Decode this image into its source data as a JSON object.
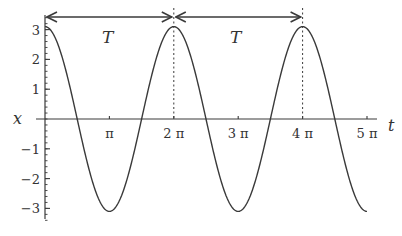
{
  "chart_data": {
    "type": "line",
    "title": "",
    "xlabel": "t",
    "ylabel": "x",
    "function": "x = 3.1 cos(t)",
    "amplitude": 3.1,
    "xlim": [
      0,
      5.0
    ],
    "xlim_units": "pi",
    "ylim": [
      -3.3,
      3.4
    ],
    "x_ticks": [
      {
        "value_pi": 1,
        "label": "π"
      },
      {
        "value_pi": 2,
        "label": "2 π"
      },
      {
        "value_pi": 3,
        "label": "3 π"
      },
      {
        "value_pi": 4,
        "label": "4 π"
      },
      {
        "value_pi": 5,
        "label": "5 π"
      }
    ],
    "y_ticks": [
      {
        "value": 3,
        "label": "3"
      },
      {
        "value": 2,
        "label": "2"
      },
      {
        "value": 1,
        "label": "1"
      },
      {
        "value": -1,
        "label": "-1"
      },
      {
        "value": -2,
        "label": "-2"
      },
      {
        "value": -3,
        "label": "-3"
      }
    ],
    "series": [
      {
        "name": "x(t)",
        "x_pi": [
          0,
          0.5,
          1,
          1.5,
          2,
          2.5,
          3,
          3.5,
          4,
          4.5,
          5
        ],
        "values": [
          3.1,
          0,
          -3.1,
          0,
          3.1,
          0,
          -3.1,
          0,
          3.1,
          0,
          -3.1
        ]
      }
    ],
    "annotations": [
      {
        "type": "double-arrow",
        "from_pi": 0,
        "to_pi": 2,
        "label": "T"
      },
      {
        "type": "double-arrow",
        "from_pi": 2,
        "to_pi": 4,
        "label": "T"
      },
      {
        "type": "dashed-vline",
        "at_pi": 2
      },
      {
        "type": "dashed-vline",
        "at_pi": 4
      }
    ],
    "grid": false,
    "legend": false
  },
  "labels": {
    "x_axis": "t",
    "y_axis": "x",
    "period_1": "T",
    "period_2": "T"
  },
  "colors": {
    "line": "#3a3a3a",
    "axis": "#3a3a3a",
    "text": "#333333",
    "background": "#ffffff"
  }
}
